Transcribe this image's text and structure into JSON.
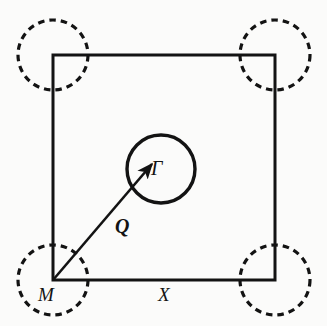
{
  "figure": {
    "type": "brillouin-zone-diagram",
    "background_color": "#fbfbfa",
    "stroke_color": "#131313",
    "labels": {
      "gamma": "Γ",
      "q_vector": "Q",
      "m_point": "M",
      "x_point": "X"
    },
    "geometry": {
      "square": {
        "name": "brillouin-zone-boundary",
        "x": 53,
        "y": 55,
        "width": 222,
        "height": 225,
        "stroke_width": 3,
        "dashed": false
      },
      "center_circle": {
        "name": "gamma-pocket",
        "cx": 161,
        "cy": 169,
        "r": 34,
        "stroke_width": 3.4,
        "dashed": false
      },
      "corner_circles": [
        {
          "name": "m-pocket-top-left",
          "cx": 53,
          "cy": 55,
          "r": 35
        },
        {
          "name": "m-pocket-top-right",
          "cx": 275,
          "cy": 55,
          "r": 35
        },
        {
          "name": "m-pocket-bottom-left",
          "cx": 53,
          "cy": 280,
          "r": 35
        },
        {
          "name": "m-pocket-bottom-right",
          "cx": 275,
          "cy": 280,
          "r": 35
        }
      ],
      "corner_circle_style": {
        "stroke_width": 3.2,
        "dash_array": "6.5 5"
      },
      "q_arrow": {
        "name": "q-wavevector-arrow",
        "x1": 53,
        "y1": 280,
        "x2": 152,
        "y2": 164,
        "stroke_width": 2.6,
        "arrowhead": true
      }
    }
  }
}
